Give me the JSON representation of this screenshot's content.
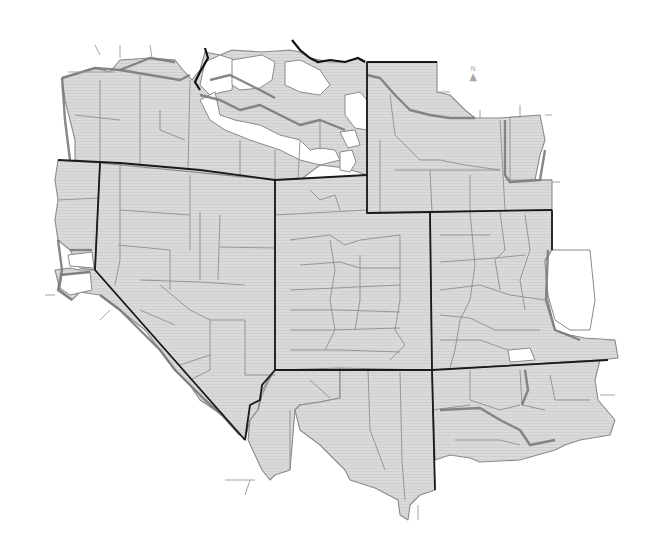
{
  "map": {
    "type": "county choropleth outline map",
    "region": "Western United States",
    "colors": {
      "fill": "#d9d9d9",
      "fill_hatch": "#cfcfcf",
      "unshaded": "#ffffff",
      "county_border": "#8f8f8f",
      "district_border": "#7a7a7a",
      "state_border": "#1a1a1a",
      "background": "#ffffff"
    },
    "north_arrow": {
      "label": "N",
      "glyph": "▲"
    },
    "legend": null
  }
}
